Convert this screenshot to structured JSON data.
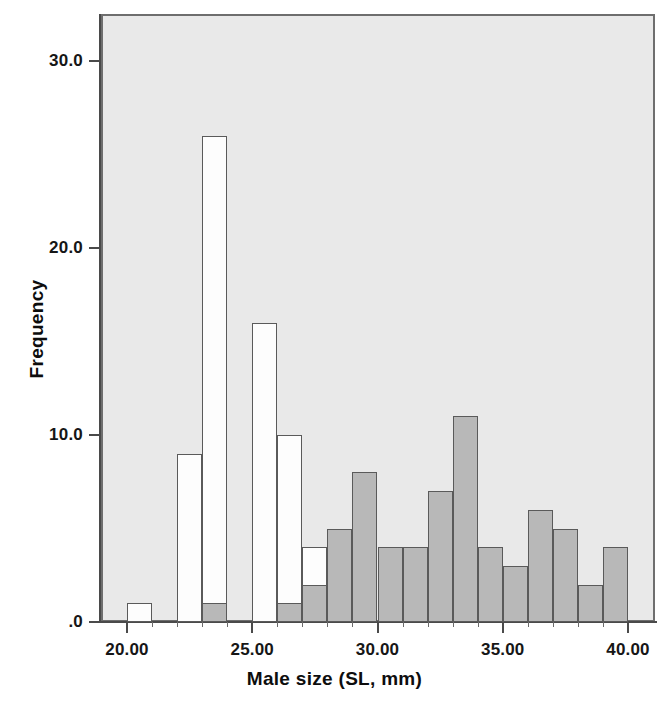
{
  "chart_data": {
    "type": "bar",
    "title": "",
    "subtitle": "",
    "xlabel": "Male size (SL, mm)",
    "ylabel": "Frequency",
    "xlim": [
      19.0,
      40.5
    ],
    "ylim": [
      0,
      34
    ],
    "grid": false,
    "legend_position": "none",
    "bin_width": 1,
    "x_ticks": [
      {
        "value": 20,
        "label": "20.00"
      },
      {
        "value": 25,
        "label": "25.00"
      },
      {
        "value": 30,
        "label": "30.00"
      },
      {
        "value": 35,
        "label": "35.00"
      },
      {
        "value": 40,
        "label": "40.00"
      }
    ],
    "y_ticks": [
      {
        "value": 0,
        "label": ".0"
      },
      {
        "value": 10,
        "label": "10.0"
      },
      {
        "value": 20,
        "label": "20.0"
      },
      {
        "value": 30,
        "label": "30.0"
      }
    ],
    "series": [
      {
        "name": "white",
        "fill": "#fdfdfd",
        "edge": "#5a5a5a",
        "bins": [
          {
            "x0": 20,
            "x1": 21,
            "value": 1
          },
          {
            "x0": 21,
            "x1": 22,
            "value": 0
          },
          {
            "x0": 22,
            "x1": 23,
            "value": 9
          },
          {
            "x0": 23,
            "x1": 24,
            "value": 26
          },
          {
            "x0": 24,
            "x1": 25,
            "value": 0
          },
          {
            "x0": 25,
            "x1": 26,
            "value": 16
          },
          {
            "x0": 26,
            "x1": 27,
            "value": 10
          },
          {
            "x0": 27,
            "x1": 28,
            "value": 4
          }
        ]
      },
      {
        "name": "gray",
        "fill": "#b8b8b8",
        "edge": "#5a5a5a",
        "bins": [
          {
            "x0": 23,
            "x1": 24,
            "value": 1
          },
          {
            "x0": 26,
            "x1": 27,
            "value": 1
          },
          {
            "x0": 27,
            "x1": 28,
            "value": 2
          },
          {
            "x0": 28,
            "x1": 29,
            "value": 5
          },
          {
            "x0": 29,
            "x1": 30,
            "value": 8
          },
          {
            "x0": 30,
            "x1": 31,
            "value": 4
          },
          {
            "x0": 31,
            "x1": 32,
            "value": 4
          },
          {
            "x0": 32,
            "x1": 33,
            "value": 7
          },
          {
            "x0": 33,
            "x1": 34,
            "value": 11
          },
          {
            "x0": 34,
            "x1": 35,
            "value": 4
          },
          {
            "x0": 35,
            "x1": 36,
            "value": 3
          },
          {
            "x0": 36,
            "x1": 37,
            "value": 6
          },
          {
            "x0": 37,
            "x1": 38,
            "value": 5
          },
          {
            "x0": 38,
            "x1": 39,
            "value": 2
          },
          {
            "x0": 39,
            "x1": 40,
            "value": 4
          }
        ]
      }
    ],
    "colors": {
      "plot_background": "#e9e9e9",
      "frame": "#6e6e6e",
      "axis": "#4a4a4a",
      "white_bar": "#fdfdfd",
      "gray_bar": "#b8b8b8",
      "bar_edge": "#5a5a5a",
      "text": "#111111"
    }
  }
}
